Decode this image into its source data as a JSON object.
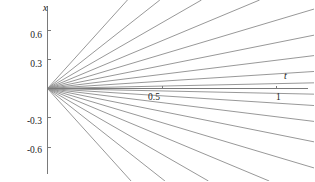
{
  "chart_data": {
    "type": "line",
    "title": "",
    "subtitle": "",
    "xlabel": "t",
    "ylabel": "x",
    "xlim": [
      -0.09,
      1.24
    ],
    "ylim": [
      -0.86,
      0.86
    ],
    "grid": false,
    "legend": null,
    "legend_position": "none",
    "xticks": [
      0.5,
      1
    ],
    "xtick_labels": [
      "0.5",
      "1"
    ],
    "yticks": [
      0.6,
      0.3,
      -0.3,
      -0.6
    ],
    "ytick_labels": [
      "0.6",
      "0.3",
      "-0.3",
      "-0.6"
    ],
    "origin_label": "",
    "series_form": "x = C * t",
    "slopes": [
      2.6,
      1.85,
      1.35,
      0.98,
      0.7,
      0.47,
      0.29,
      0.15,
      0.05,
      -0.05,
      -0.15,
      -0.29,
      -0.47,
      -0.7,
      -0.98,
      -1.35,
      -1.85,
      -2.6
    ],
    "series": [
      {
        "name": "C = 2.6",
        "slope": 2.6,
        "x": [
          0,
          1.24
        ],
        "values": [
          0,
          3.224
        ]
      },
      {
        "name": "C = 1.85",
        "slope": 1.85,
        "x": [
          0,
          1.24
        ],
        "values": [
          0,
          2.294
        ]
      },
      {
        "name": "C = 1.35",
        "slope": 1.35,
        "x": [
          0,
          1.24
        ],
        "values": [
          0,
          1.674
        ]
      },
      {
        "name": "C = 0.98",
        "slope": 0.98,
        "x": [
          0,
          1.24
        ],
        "values": [
          0,
          1.2152
        ]
      },
      {
        "name": "C = 0.7",
        "slope": 0.7,
        "x": [
          0,
          1.24
        ],
        "values": [
          0,
          0.868
        ]
      },
      {
        "name": "C = 0.47",
        "slope": 0.47,
        "x": [
          0,
          1.24
        ],
        "values": [
          0,
          0.5828
        ]
      },
      {
        "name": "C = 0.29",
        "slope": 0.29,
        "x": [
          0,
          1.24
        ],
        "values": [
          0,
          0.3596
        ]
      },
      {
        "name": "C = 0.15",
        "slope": 0.15,
        "x": [
          0,
          1.24
        ],
        "values": [
          0,
          0.186
        ]
      },
      {
        "name": "C = 0.05",
        "slope": 0.05,
        "x": [
          0,
          1.24
        ],
        "values": [
          0,
          0.062
        ]
      },
      {
        "name": "C = -0.05",
        "slope": -0.05,
        "x": [
          0,
          1.24
        ],
        "values": [
          0,
          -0.062
        ]
      },
      {
        "name": "C = -0.15",
        "slope": -0.15,
        "x": [
          0,
          1.24
        ],
        "values": [
          0,
          -0.186
        ]
      },
      {
        "name": "C = -0.29",
        "slope": -0.29,
        "x": [
          0,
          1.24
        ],
        "values": [
          0,
          -0.3596
        ]
      },
      {
        "name": "C = -0.47",
        "slope": -0.47,
        "x": [
          0,
          1.24
        ],
        "values": [
          0,
          -0.5828
        ]
      },
      {
        "name": "C = -0.7",
        "slope": -0.7,
        "x": [
          0,
          1.24
        ],
        "values": [
          0,
          -0.868
        ]
      },
      {
        "name": "C = -0.98",
        "slope": -0.98,
        "x": [
          0,
          1.24
        ],
        "values": [
          0,
          -1.2152
        ]
      },
      {
        "name": "C = -1.35",
        "slope": -1.35,
        "x": [
          0,
          1.24
        ],
        "values": [
          0,
          -1.674
        ]
      },
      {
        "name": "C = -1.85",
        "slope": -1.85,
        "x": [
          0,
          1.24
        ],
        "values": [
          0,
          -2.294
        ]
      },
      {
        "name": "C = -2.6",
        "slope": -2.6,
        "x": [
          0,
          1.24
        ],
        "values": [
          0,
          -3.224
        ]
      }
    ],
    "colors": {
      "line": "#8c8c8c",
      "axis": "#7a7a7a",
      "tick_label": "#1a1a1a",
      "background": "#ffffff"
    }
  },
  "axes": {
    "x_axis_name": "t",
    "y_axis_name": "x",
    "x_tick_0": "0.5",
    "x_tick_1": "1",
    "y_tick_p6": "0.6",
    "y_tick_p3": "0.3",
    "y_tick_m3": "-0.3",
    "y_tick_m6": "-0.6"
  }
}
